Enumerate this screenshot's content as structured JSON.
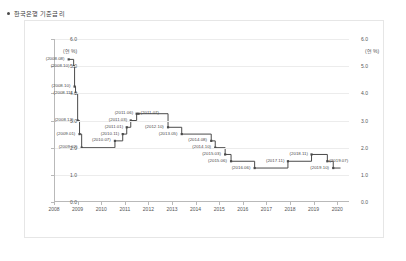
{
  "chart_data": {
    "type": "line",
    "title": "한국은행 기준금리",
    "ylabel": "(연 %)",
    "ylabel_right": "(연 %)",
    "xlabel": "",
    "ylim": [
      0.0,
      6.0
    ],
    "yticks": [
      0.0,
      1.0,
      2.0,
      3.0,
      4.0,
      5.0,
      6.0
    ],
    "ytick_labels": [
      "0.0",
      "1.0",
      "2.0",
      "3.0",
      "4.0",
      "5.0",
      "6.0"
    ],
    "xlim": [
      2008.0,
      2020.5
    ],
    "xticks": [
      2008,
      2009,
      2010,
      2011,
      2012,
      2013,
      2014,
      2015,
      2016,
      2017,
      2018,
      2019,
      2020
    ],
    "xtick_labels": [
      "2008",
      "2009",
      "2010",
      "2011",
      "2012",
      "2013",
      "2014",
      "2015",
      "2016",
      "2017",
      "2018",
      "2019",
      "2020"
    ],
    "grid": true,
    "legend": "none",
    "step_style": "post",
    "series": [
      {
        "name": "한국은행 기준금리",
        "color": "#4a4a4a",
        "points": [
          {
            "date": "2008.08",
            "x": 2008.58,
            "y": 5.25,
            "label": "(2008.08)",
            "label_side": "left"
          },
          {
            "date": "2008.10",
            "x": 2008.79,
            "y": 5.0,
            "label": "(2008.10)",
            "label_side": "left"
          },
          {
            "date": "2008.10",
            "x": 2008.83,
            "y": 4.25,
            "label": "(2008.10)",
            "label_side": "left"
          },
          {
            "date": "2008.11",
            "x": 2008.87,
            "y": 4.0,
            "label": "(2008.11)",
            "label_side": "left"
          },
          {
            "date": "2008.12",
            "x": 2008.96,
            "y": 3.0,
            "label": "(2008.12)",
            "label_side": "left"
          },
          {
            "date": "2009.01",
            "x": 2009.04,
            "y": 2.5,
            "label": "(2009.01)",
            "label_side": "left"
          },
          {
            "date": "2009.02",
            "x": 2009.13,
            "y": 2.0,
            "label": "(2009.02)",
            "label_side": "left"
          },
          {
            "date": "2010.07",
            "x": 2010.54,
            "y": 2.25,
            "label": "(2010.07)",
            "label_side": "left"
          },
          {
            "date": "2010.11",
            "x": 2010.87,
            "y": 2.5,
            "label": "(2010.11)",
            "label_side": "left"
          },
          {
            "date": "2011.01",
            "x": 2011.04,
            "y": 2.75,
            "label": "(2011.01)",
            "label_side": "left"
          },
          {
            "date": "2011.03",
            "x": 2011.21,
            "y": 3.0,
            "label": "(2011.03)",
            "label_side": "left"
          },
          {
            "date": "2011.06",
            "x": 2011.46,
            "y": 3.25,
            "label": "(2011.06)",
            "label_side": "left"
          },
          {
            "date": "2011.07",
            "x": 2011.54,
            "y": 3.25,
            "label": "(2011.07)",
            "label_side": "right"
          },
          {
            "date": "2012.10",
            "x": 2012.79,
            "y": 2.75,
            "label": "(2012.10)",
            "label_side": "left"
          },
          {
            "date": "2013.05",
            "x": 2013.37,
            "y": 2.5,
            "label": "(2013.05)",
            "label_side": "left"
          },
          {
            "date": "2014.08",
            "x": 2014.62,
            "y": 2.25,
            "label": "(2014.08)",
            "label_side": "left"
          },
          {
            "date": "2014.10",
            "x": 2014.79,
            "y": 2.0,
            "label": "(2014.10)",
            "label_side": "left"
          },
          {
            "date": "2015.03",
            "x": 2015.21,
            "y": 1.75,
            "label": "(2015.03)",
            "label_side": "left"
          },
          {
            "date": "2015.06",
            "x": 2015.46,
            "y": 1.5,
            "label": "(2015.06)",
            "label_side": "left"
          },
          {
            "date": "2016.06",
            "x": 2016.46,
            "y": 1.25,
            "label": "(2016.06)",
            "label_side": "left"
          },
          {
            "date": "2017.11",
            "x": 2017.87,
            "y": 1.5,
            "label": "(2017.11)",
            "label_side": "left"
          },
          {
            "date": "2018.11",
            "x": 2018.87,
            "y": 1.75,
            "label": "(2018.11)",
            "label_side": "left"
          },
          {
            "date": "2019.07",
            "x": 2019.54,
            "y": 1.5,
            "label": "(2019.07)",
            "label_side": "right"
          },
          {
            "date": "2019.10",
            "x": 2019.79,
            "y": 1.25,
            "label": "(2019.10)",
            "label_side": "left"
          }
        ]
      }
    ]
  }
}
